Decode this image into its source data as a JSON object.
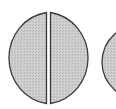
{
  "diagram": {
    "shapes": [
      {
        "type": "left-semicircle",
        "fill": "#c8c8c8",
        "stroke": "#3a3a3a"
      },
      {
        "type": "right-semicircle",
        "fill": "#c8c8c8",
        "stroke": "#3a3a3a"
      },
      {
        "type": "partial-circle",
        "fill": "#c8c8c8",
        "stroke": "#3a3a3a"
      }
    ]
  }
}
